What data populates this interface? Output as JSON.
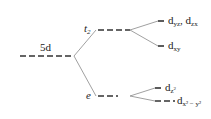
{
  "diagram": {
    "levels": {
      "parent": "5d",
      "t2": {
        "symbol": "t",
        "sub": "2"
      },
      "e": {
        "symbol": "e"
      }
    },
    "orbitals": {
      "dyz_dzx": {
        "base": "d",
        "sub1": "yz",
        "sep": ", ",
        "base2": "d",
        "sub2": "zx"
      },
      "dxy": {
        "base": "d",
        "sub": "xy"
      },
      "dz2": {
        "base": "d",
        "sub": "z",
        "sup": "2"
      },
      "dx2y2": {
        "base": "d",
        "sub": "x² − y²"
      }
    },
    "colors": {
      "line": "#333333",
      "connector": "#888888"
    }
  }
}
